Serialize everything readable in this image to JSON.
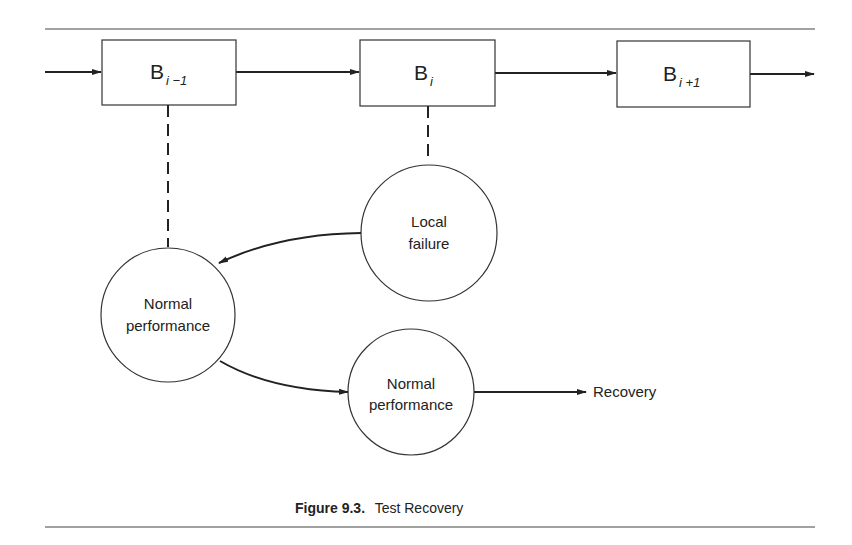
{
  "figure": {
    "caption_label": "Figure 9.3.",
    "caption_text": "Test Recovery"
  },
  "blocks": [
    {
      "base": "B",
      "subscript": "i −1"
    },
    {
      "base": "B",
      "subscript": "i"
    },
    {
      "base": "B",
      "subscript": "i +1"
    }
  ],
  "nodes": {
    "normal_performance_1": {
      "line1": "Normal",
      "line2": "performance"
    },
    "local_failure": {
      "line1": "Local",
      "line2": "failure"
    },
    "normal_performance_2": {
      "line1": "Normal",
      "line2": "performance"
    }
  },
  "outputs": {
    "recovery": "Recovery"
  },
  "colors": {
    "ink": "#222222",
    "background": "#ffffff"
  }
}
